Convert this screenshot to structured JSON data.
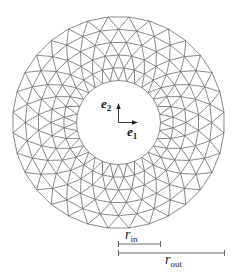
{
  "figure": {
    "type": "annular-triangular-mesh",
    "center": [
      118.5,
      122.5
    ],
    "inner_radius_px": 42,
    "outer_radius_px": 106,
    "radial_node_count": 6,
    "angular_divisions": 32,
    "stroke_color": "#6b6b6b",
    "stroke_width": 0.8
  },
  "axes": {
    "e1": {
      "base": "e",
      "sub": "1"
    },
    "e2": {
      "base": "e",
      "sub": "2"
    },
    "color": "#222222"
  },
  "dimensions": {
    "r_in": {
      "base": "r",
      "sub": "in"
    },
    "r_out": {
      "base": "r",
      "sub": "out"
    }
  }
}
